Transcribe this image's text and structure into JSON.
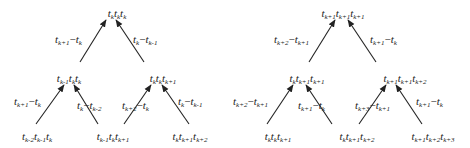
{
  "diagrams": [
    {
      "id": "left",
      "nodes": [
        {
          "id": "top",
          "terms": [
            [
              "t",
              "k"
            ],
            [
              "t",
              "k"
            ],
            [
              "t",
              "k"
            ]
          ],
          "x": 117,
          "y": 8
        },
        {
          "id": "mid-left",
          "terms": [
            [
              "t",
              "k-1"
            ],
            [
              "t",
              "k"
            ],
            [
              "t",
              "k"
            ]
          ],
          "x": 69,
          "y": 73
        },
        {
          "id": "mid-right",
          "terms": [
            [
              "t",
              "k"
            ],
            [
              "t",
              "k"
            ],
            [
              "t",
              "k+1"
            ]
          ],
          "x": 163,
          "y": 73
        },
        {
          "id": "bot-1",
          "terms": [
            [
              "t",
              "k-2"
            ],
            [
              "t",
              "k-1"
            ],
            [
              "t",
              "k"
            ]
          ],
          "x": 37,
          "y": 131
        },
        {
          "id": "bot-2",
          "terms": [
            [
              "t",
              "k-1"
            ],
            [
              "t",
              "k"
            ],
            [
              "t",
              "k+1"
            ]
          ],
          "x": 113,
          "y": 131
        },
        {
          "id": "bot-3",
          "terms": [
            [
              "t",
              "k"
            ],
            [
              "t",
              "k+1"
            ],
            [
              "t",
              "k+2"
            ]
          ],
          "x": 190,
          "y": 131
        }
      ],
      "edges": [
        {
          "label": [
            [
              "t",
              "k+1"
            ],
            "−",
            [
              "t",
              "k"
            ]
          ],
          "lx": 55,
          "ly": 34,
          "x1": 80,
          "y1": 62,
          "x2": 106,
          "y2": 20
        },
        {
          "label": [
            [
              "t",
              "k"
            ],
            "−",
            [
              "t",
              "k-1"
            ]
          ],
          "lx": 133,
          "ly": 34,
          "x1": 144,
          "y1": 62,
          "x2": 116,
          "y2": 20
        },
        {
          "label": [
            [
              "t",
              "k+1"
            ],
            "−",
            [
              "t",
              "k"
            ]
          ],
          "lx": 14,
          "ly": 96,
          "x1": 36,
          "y1": 124,
          "x2": 64,
          "y2": 85
        },
        {
          "label": [
            [
              "t",
              "k"
            ],
            "−",
            [
              "t",
              "k-2"
            ]
          ],
          "lx": 77,
          "ly": 100,
          "x1": 98,
          "y1": 124,
          "x2": 74,
          "y2": 85
        },
        {
          "label": [
            [
              "t",
              "k+2"
            ],
            "−",
            [
              "t",
              "k"
            ]
          ],
          "lx": 122,
          "ly": 100,
          "x1": 124,
          "y1": 124,
          "x2": 151,
          "y2": 85
        },
        {
          "label": [
            [
              "t",
              "k"
            ],
            "−",
            [
              "t",
              "k-1"
            ]
          ],
          "lx": 178,
          "ly": 96,
          "x1": 189,
          "y1": 124,
          "x2": 162,
          "y2": 85
        }
      ]
    },
    {
      "id": "right",
      "nodes": [
        {
          "id": "top",
          "terms": [
            [
              "t",
              "k+1"
            ],
            [
              "t",
              "k+1"
            ],
            [
              "t",
              "k+1"
            ]
          ],
          "x": 343,
          "y": 8
        },
        {
          "id": "mid-left",
          "terms": [
            [
              "t",
              "k"
            ],
            [
              "t",
              "k+1"
            ],
            [
              "t",
              "k+1"
            ]
          ],
          "x": 307,
          "y": 73
        },
        {
          "id": "mid-right",
          "terms": [
            [
              "t",
              "k+1"
            ],
            [
              "t",
              "k+1"
            ],
            [
              "t",
              "k+2"
            ]
          ],
          "x": 405,
          "y": 73
        },
        {
          "id": "bot-1",
          "terms": [
            [
              "t",
              "k"
            ],
            [
              "t",
              "k"
            ],
            [
              "t",
              "k+1"
            ]
          ],
          "x": 278,
          "y": 131
        },
        {
          "id": "bot-2",
          "terms": [
            [
              "t",
              "k"
            ],
            [
              "t",
              "k+1"
            ],
            [
              "t",
              "k+2"
            ]
          ],
          "x": 357,
          "y": 131
        },
        {
          "id": "bot-3",
          "terms": [
            [
              "t",
              "k+1"
            ],
            [
              "t",
              "k+2"
            ],
            [
              "t",
              "k+3"
            ]
          ],
          "x": 433,
          "y": 131
        }
      ],
      "edges": [
        {
          "label": [
            [
              "t",
              "k+2"
            ],
            "−",
            [
              "t",
              "k+1"
            ]
          ],
          "lx": 274,
          "ly": 34,
          "x1": 309,
          "y1": 62,
          "x2": 335,
          "y2": 20
        },
        {
          "label": [
            [
              "t",
              "k+1"
            ],
            "−",
            [
              "t",
              "k"
            ]
          ],
          "lx": 370,
          "ly": 34,
          "x1": 376,
          "y1": 62,
          "x2": 348,
          "y2": 20
        },
        {
          "label": [
            [
              "t",
              "k+2"
            ],
            "−",
            [
              "t",
              "k+1"
            ]
          ],
          "lx": 233,
          "ly": 96,
          "x1": 267,
          "y1": 124,
          "x2": 293,
          "y2": 85
        },
        {
          "label": [
            [
              "t",
              "k+1"
            ],
            "−",
            [
              "t",
              "k"
            ]
          ],
          "lx": 298,
          "ly": 100,
          "x1": 332,
          "y1": 124,
          "x2": 306,
          "y2": 85
        },
        {
          "label": [
            [
              "t",
              "k+3"
            ],
            "−",
            [
              "t",
              "k+1"
            ]
          ],
          "lx": 355,
          "ly": 100,
          "x1": 359,
          "y1": 124,
          "x2": 386,
          "y2": 85
        },
        {
          "label": [
            [
              "t",
              "k+1"
            ],
            "−",
            [
              "t",
              "k"
            ]
          ],
          "lx": 416,
          "ly": 96,
          "x1": 422,
          "y1": 124,
          "x2": 396,
          "y2": 85
        }
      ]
    }
  ],
  "colors": {
    "line": "#222222",
    "text": "#222222",
    "background": "#ffffff"
  }
}
